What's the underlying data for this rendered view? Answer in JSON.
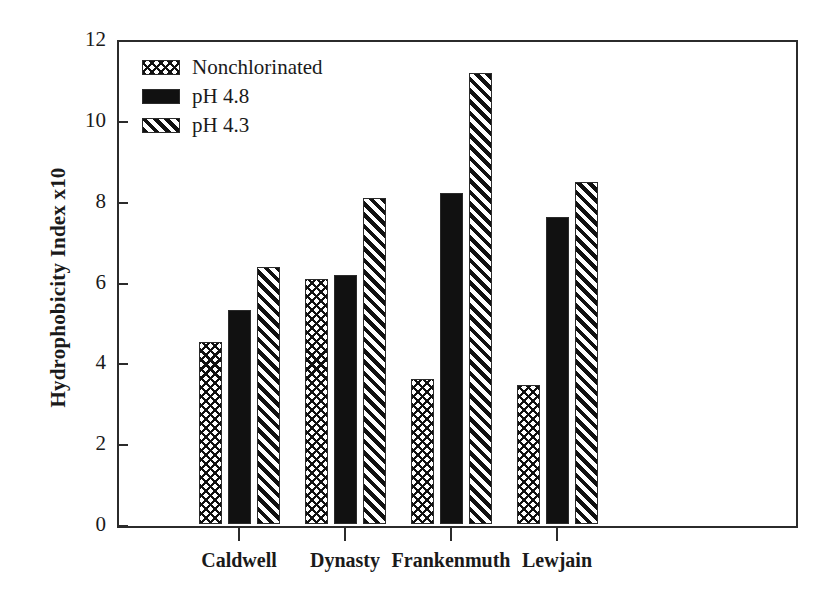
{
  "chart_data": {
    "type": "bar",
    "title": "",
    "xlabel": "",
    "ylabel": "Hydrophobicity Index x10",
    "categories": [
      "Caldwell",
      "Dynasty",
      "Frankenmuth",
      "Lewjain"
    ],
    "series": [
      {
        "name": "Nonchlorinated",
        "pattern": "crosshatch",
        "values": [
          4.5,
          6.05,
          3.6,
          3.45
        ]
      },
      {
        "name": "pH 4.8",
        "pattern": "solid-black",
        "values": [
          5.3,
          6.17,
          8.2,
          7.6
        ]
      },
      {
        "name": "pH 4.3",
        "pattern": "diagonal-stripe",
        "values": [
          6.35,
          8.07,
          11.15,
          8.45
        ]
      }
    ],
    "ylim": [
      0,
      12
    ],
    "yticks": [
      0,
      2,
      4,
      6,
      8,
      10,
      12
    ],
    "ytick_labels": [
      "0",
      "2",
      "4",
      "6",
      "8",
      "10",
      "12"
    ],
    "grid": false,
    "legend_position": "upper-left-inside",
    "colors": {
      "ink": "#111111",
      "axis": "#2b2b2b",
      "background": "#ffffff"
    }
  },
  "legend": {
    "items": [
      {
        "label": "Nonchlorinated",
        "pattern": "crosshatch"
      },
      {
        "label": "pH 4.8",
        "pattern": "solid-black"
      },
      {
        "label": "pH 4.3",
        "pattern": "diagonal-stripe"
      }
    ]
  }
}
